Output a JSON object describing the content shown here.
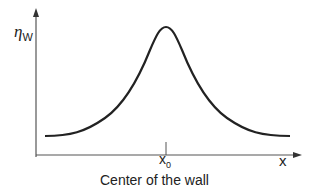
{
  "diagram": {
    "y_axis": {
      "symbol": "η",
      "subscript": "W"
    },
    "x_axis": {
      "label": "x"
    },
    "tick": {
      "symbol": "x",
      "subscript": "0"
    },
    "caption": "Center of the wall",
    "curve": "bell-shaped peak centered at x0",
    "colors": {
      "line": "#222222",
      "axis": "#555555"
    }
  }
}
